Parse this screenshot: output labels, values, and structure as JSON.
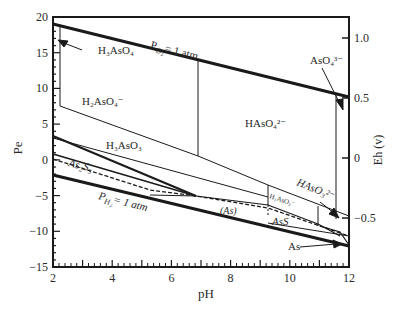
{
  "diagram": {
    "type": "Pe-pH (Eh-pH) stability diagram",
    "x_axis": {
      "label": "pH",
      "ticks": [
        "2",
        "4",
        "6",
        "8",
        "10",
        "12"
      ]
    },
    "y_axis_left": {
      "label": "Pe",
      "ticks": [
        "20",
        "15",
        "10",
        "5",
        "0",
        "−5",
        "−10",
        "−15"
      ]
    },
    "y_axis_right": {
      "label": "Eh (v)",
      "ticks": [
        "1.0",
        "0.5",
        "0",
        "−0.5"
      ]
    },
    "labels": {
      "po2": "P",
      "po2_sub": "O₂",
      "po2_rest": "= 1 atm",
      "ph2": "P",
      "ph2_sub": "H₂",
      "ph2_rest": "= 1 atm",
      "h3aso4": "H₃AsO₄",
      "h2aso4": "H₂AsO₄⁻",
      "haso4": "HAsO₄²⁻",
      "aso4": "AsO₄³⁻",
      "h3aso3": "H₃AsO₃",
      "h2aso3": "H₂AsO₃⁻",
      "haso3": "HAsO₃²⁻",
      "as2s3": "As₂S₃",
      "as_paren": "(As)",
      "ass": "AsS",
      "as": "As"
    }
  }
}
